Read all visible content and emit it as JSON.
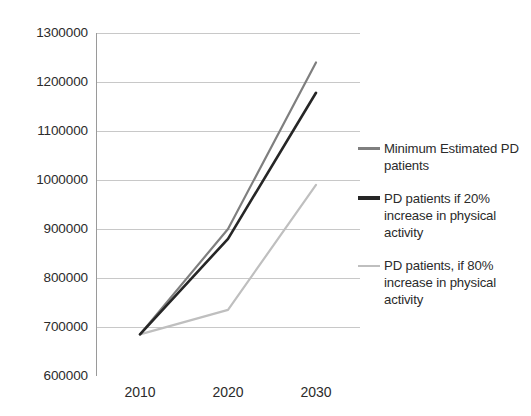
{
  "chart_data": {
    "type": "line",
    "title": "",
    "subtitle": "",
    "xlabel": "",
    "ylabel": "",
    "x": [
      2010,
      2020,
      2030
    ],
    "categories": [
      "2010",
      "2020",
      "2030"
    ],
    "xtick_labels": [
      "2010",
      "2020",
      "2030"
    ],
    "ytick_labels": [
      "1300000",
      "1200000",
      "1100000",
      "1000000",
      "900000",
      "800000",
      "700000",
      "600000"
    ],
    "ytick_values": [
      1300000,
      1200000,
      1100000,
      1000000,
      900000,
      800000,
      700000,
      600000
    ],
    "ylim": [
      600000,
      1300000
    ],
    "xlim": [
      2005,
      2035
    ],
    "grid": true,
    "grid_axis": "y",
    "legend_position": "right",
    "series": [
      {
        "name": "Minimum Estimated PD patients",
        "color": "#7f7f7f",
        "line_width": 2.2,
        "values": [
          685000,
          900000,
          1240000
        ]
      },
      {
        "name": "PD patients if 20% increase in physical activity",
        "color": "#262626",
        "line_width": 2.6,
        "values": [
          685000,
          880000,
          1178000
        ]
      },
      {
        "name": "PD patients, if 80% increase in physical activity",
        "color": "#bfbfbf",
        "line_width": 2.2,
        "values": [
          685000,
          735000,
          990000
        ]
      }
    ]
  },
  "legend": {
    "entries": [
      {
        "label": "Minimum Estimated PD patients",
        "color": "#7f7f7f",
        "weight": "normal"
      },
      {
        "label": "PD patients if 20% increase in physical activity",
        "color": "#262626",
        "weight": "thick"
      },
      {
        "label": "PD patients, if 80% increase in physical activity",
        "color": "#bfbfbf",
        "weight": "thin"
      }
    ]
  },
  "axes": {
    "y_labels": [
      "1300000",
      "1200000",
      "1100000",
      "1000000",
      "900000",
      "800000",
      "700000",
      "600000"
    ],
    "x_labels": [
      "2010",
      "2020",
      "2030"
    ]
  },
  "colors": {
    "grid": "#c8c8c8",
    "axis": "#9a9a9a",
    "text": "#2b2b2b",
    "background": "#ffffff"
  }
}
